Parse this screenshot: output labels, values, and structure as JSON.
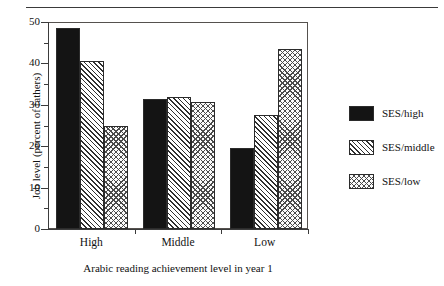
{
  "chart_data": {
    "type": "bar",
    "title": "",
    "xlabel": "Arabic reading achievement level in year 1",
    "ylabel": "Job level (percent of fathers)",
    "categories": [
      "High",
      "Middle",
      "Low"
    ],
    "series": [
      {
        "name": "SES/high",
        "pattern": "solid",
        "values": [
          48.5,
          31.5,
          19.5
        ]
      },
      {
        "name": "SES/middle",
        "pattern": "diagonal",
        "values": [
          40.5,
          32.0,
          27.5
        ]
      },
      {
        "name": "SES/low",
        "pattern": "crosshatch",
        "values": [
          25.0,
          30.8,
          43.5
        ]
      }
    ],
    "ylim": [
      0,
      50
    ],
    "yticks": [
      0,
      10,
      20,
      30,
      40,
      50
    ],
    "ytick_labels": [
      "0",
      "10",
      "20",
      "30",
      "40",
      "50"
    ],
    "yminor_ticks": [
      5,
      15,
      25,
      35,
      45
    ],
    "grid": false,
    "legend_position": "right",
    "colors": {
      "solid": "#141414",
      "hatch_line": "#2f2f2f",
      "cross_line": "#4a4a4a",
      "axis": "#3b3b3b",
      "frame": "#55514e",
      "background": "#ffffff"
    }
  },
  "legend": {
    "items": [
      {
        "label": "SES/high"
      },
      {
        "label": "SES/middle"
      },
      {
        "label": "SES/low"
      }
    ]
  }
}
